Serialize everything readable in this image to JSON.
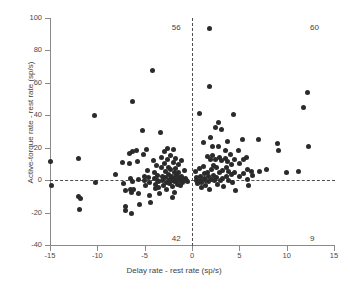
{
  "chart_data": {
    "type": "scatter",
    "title": "",
    "xlabel": "Delay rate - rest rate  (sp/s)",
    "ylabel": "Active-torque rate - rest rate  (sp/s)",
    "xlim": [
      -15,
      15
    ],
    "ylim": [
      -40,
      100
    ],
    "xticks": [
      -15,
      -10,
      -5,
      0,
      5,
      10,
      15
    ],
    "yticks": [
      -40,
      -20,
      0,
      20,
      40,
      60,
      80,
      100
    ],
    "xtick_labels": [
      "-15",
      "-10",
      "-5",
      "0",
      "5",
      "10",
      "15"
    ],
    "ytick_labels": [
      "-40",
      "-20",
      "0",
      "20",
      "40",
      "60",
      "80",
      "100"
    ],
    "grid": false,
    "legend": null,
    "reference_lines": [
      {
        "orientation": "vertical",
        "value": 0,
        "style": "dashed"
      },
      {
        "orientation": "horizontal",
        "value": 0,
        "style": "dashed"
      }
    ],
    "annotations": [
      {
        "text": "56",
        "x": -1.4,
        "y": 94,
        "meaning": "count-upper-left-quadrant"
      },
      {
        "text": "60",
        "x": 13.2,
        "y": 94,
        "meaning": "count-upper-right-quadrant"
      },
      {
        "text": "42",
        "x": -1.4,
        "y": -36,
        "meaning": "count-lower-left-quadrant"
      },
      {
        "text": "9",
        "x": 13.2,
        "y": -36,
        "meaning": "count-lower-right-quadrant"
      }
    ],
    "marker": {
      "shape": "circle",
      "color": "#2b2b2b",
      "size": 5
    },
    "points": [
      [
        -14.9,
        11.5
      ],
      [
        -14.8,
        -3.0
      ],
      [
        -12.0,
        13.5
      ],
      [
        -12.0,
        -10.0
      ],
      [
        -11.8,
        -11.5
      ],
      [
        -11.9,
        -18.0
      ],
      [
        -10.3,
        39.7
      ],
      [
        -10.2,
        -1.5
      ],
      [
        -8.1,
        3.5
      ],
      [
        -7.3,
        11.0
      ],
      [
        -7.2,
        -2.0
      ],
      [
        -7.0,
        -6.5
      ],
      [
        -7.0,
        -16.0
      ],
      [
        -7.0,
        -19.0
      ],
      [
        -6.6,
        16.5
      ],
      [
        -6.6,
        10.5
      ],
      [
        -6.5,
        1.0
      ],
      [
        -6.5,
        -5.5
      ],
      [
        -6.4,
        -7.5
      ],
      [
        -6.4,
        -20.5
      ],
      [
        -6.3,
        48.5
      ],
      [
        -6.3,
        17.5
      ],
      [
        -6.3,
        -1.0
      ],
      [
        -6.2,
        -6.0
      ],
      [
        -5.9,
        18.0
      ],
      [
        -5.8,
        11.5
      ],
      [
        -5.7,
        0.5
      ],
      [
        -5.6,
        -8.5
      ],
      [
        -5.5,
        -15.0
      ],
      [
        -5.2,
        30.8
      ],
      [
        -5.1,
        16.0
      ],
      [
        -5.0,
        2.5
      ],
      [
        -5.0,
        -0.5
      ],
      [
        -4.9,
        -3.5
      ],
      [
        -4.8,
        19.0
      ],
      [
        -4.7,
        6.0
      ],
      [
        -4.6,
        1.5
      ],
      [
        -4.5,
        -1.5
      ],
      [
        -4.5,
        -9.5
      ],
      [
        -4.4,
        -13.5
      ],
      [
        -4.2,
        67.5
      ],
      [
        -4.1,
        12.0
      ],
      [
        -4.0,
        5.0
      ],
      [
        -4.0,
        1.0
      ],
      [
        -3.9,
        -2.5
      ],
      [
        -3.9,
        -5.0
      ],
      [
        -3.7,
        9.0
      ],
      [
        -3.6,
        3.0
      ],
      [
        -3.6,
        0.0
      ],
      [
        -3.5,
        -1.0
      ],
      [
        -3.5,
        -4.5
      ],
      [
        -3.4,
        -8.0
      ],
      [
        -3.3,
        29.3
      ],
      [
        -3.2,
        14.0
      ],
      [
        -3.2,
        7.5
      ],
      [
        -3.1,
        2.0
      ],
      [
        -3.1,
        -0.5
      ],
      [
        -3.0,
        -3.0
      ],
      [
        -2.9,
        17.5
      ],
      [
        -2.9,
        10.0
      ],
      [
        -2.8,
        5.5
      ],
      [
        -2.8,
        1.5
      ],
      [
        -2.7,
        -1.5
      ],
      [
        -2.7,
        -6.0
      ],
      [
        -2.6,
        19.5
      ],
      [
        -2.6,
        12.5
      ],
      [
        -2.5,
        8.0
      ],
      [
        -2.5,
        3.5
      ],
      [
        -2.4,
        0.5
      ],
      [
        -2.4,
        -2.0
      ],
      [
        -2.3,
        15.0
      ],
      [
        -2.3,
        6.5
      ],
      [
        -2.2,
        2.5
      ],
      [
        -2.2,
        -0.5
      ],
      [
        -2.1,
        -4.0
      ],
      [
        -2.1,
        -11.0
      ],
      [
        -2.0,
        19.0
      ],
      [
        -2.0,
        11.0
      ],
      [
        -1.9,
        4.5
      ],
      [
        -1.9,
        1.0
      ],
      [
        -1.8,
        -1.0
      ],
      [
        -1.8,
        -7.5
      ],
      [
        -1.7,
        13.5
      ],
      [
        -1.7,
        7.0
      ],
      [
        -1.6,
        3.0
      ],
      [
        -1.6,
        0.0
      ],
      [
        -1.5,
        -2.5
      ],
      [
        -1.4,
        9.5
      ],
      [
        -1.4,
        5.0
      ],
      [
        -1.3,
        1.5
      ],
      [
        -1.3,
        -0.5
      ],
      [
        -1.2,
        -3.5
      ],
      [
        -1.1,
        12.0
      ],
      [
        -1.1,
        2.0
      ],
      [
        -1.0,
        0.5
      ],
      [
        -1.0,
        -1.5
      ],
      [
        -0.8,
        6.0
      ],
      [
        -0.7,
        1.0
      ],
      [
        -0.6,
        0.0
      ],
      [
        -0.5,
        -1.0
      ],
      [
        0.4,
        5.5
      ],
      [
        0.5,
        1.5
      ],
      [
        0.5,
        -0.5
      ],
      [
        0.6,
        -2.0
      ],
      [
        0.8,
        41.3
      ],
      [
        0.8,
        7.0
      ],
      [
        0.9,
        2.5
      ],
      [
        0.9,
        0.0
      ],
      [
        1.0,
        -1.5
      ],
      [
        1.0,
        -4.5
      ],
      [
        1.2,
        23.0
      ],
      [
        1.2,
        8.5
      ],
      [
        1.3,
        4.0
      ],
      [
        1.3,
        1.0
      ],
      [
        1.4,
        -0.5
      ],
      [
        1.4,
        -3.0
      ],
      [
        1.6,
        14.5
      ],
      [
        1.6,
        5.0
      ],
      [
        1.7,
        2.0
      ],
      [
        1.7,
        -1.0
      ],
      [
        1.8,
        -5.5
      ],
      [
        1.9,
        93.3
      ],
      [
        1.9,
        58.0
      ],
      [
        2.0,
        26.5
      ],
      [
        2.0,
        12.5
      ],
      [
        2.1,
        6.5
      ],
      [
        2.1,
        0.5
      ],
      [
        2.2,
        20.5
      ],
      [
        2.2,
        15.5
      ],
      [
        2.3,
        9.0
      ],
      [
        2.3,
        3.0
      ],
      [
        2.4,
        -0.5
      ],
      [
        2.5,
        32.5
      ],
      [
        2.5,
        13.0
      ],
      [
        2.6,
        7.5
      ],
      [
        2.6,
        1.5
      ],
      [
        2.7,
        -2.5
      ],
      [
        2.8,
        35.5
      ],
      [
        2.8,
        21.0
      ],
      [
        2.9,
        14.0
      ],
      [
        2.9,
        4.5
      ],
      [
        3.0,
        -0.5
      ],
      [
        3.1,
        31.0
      ],
      [
        3.1,
        12.0
      ],
      [
        3.2,
        6.0
      ],
      [
        3.2,
        1.0
      ],
      [
        3.3,
        -4.0
      ],
      [
        3.5,
        18.5
      ],
      [
        3.5,
        13.5
      ],
      [
        3.6,
        8.0
      ],
      [
        3.6,
        2.5
      ],
      [
        3.8,
        24.0
      ],
      [
        3.8,
        11.5
      ],
      [
        3.9,
        5.5
      ],
      [
        3.9,
        0.0
      ],
      [
        4.1,
        16.0
      ],
      [
        4.2,
        9.5
      ],
      [
        4.2,
        3.5
      ],
      [
        4.3,
        -1.5
      ],
      [
        4.4,
        40.5
      ],
      [
        4.5,
        13.0
      ],
      [
        4.5,
        5.0
      ],
      [
        4.6,
        -6.5
      ],
      [
        4.9,
        18.5
      ],
      [
        5.0,
        10.0
      ],
      [
        5.0,
        2.0
      ],
      [
        5.3,
        24.8
      ],
      [
        5.4,
        12.5
      ],
      [
        5.4,
        4.0
      ],
      [
        5.8,
        14.0
      ],
      [
        5.9,
        6.5
      ],
      [
        5.9,
        0.5
      ],
      [
        6.0,
        -3.5
      ],
      [
        6.3,
        5.5
      ],
      [
        6.4,
        3.0
      ],
      [
        7.0,
        25.0
      ],
      [
        7.1,
        5.5
      ],
      [
        7.9,
        6.5
      ],
      [
        9.0,
        22.8
      ],
      [
        9.1,
        18.5
      ],
      [
        10.0,
        4.8
      ],
      [
        11.3,
        5.3
      ],
      [
        11.8,
        44.5
      ],
      [
        12.2,
        53.8
      ],
      [
        12.3,
        20.8
      ]
    ]
  },
  "axes": {
    "y_title": "Active-torque rate - rest rate  (sp/s)",
    "x_title": "Delay rate - rest rate  (sp/s)"
  },
  "quadrant_counts": {
    "upper_left": "56",
    "upper_right": "60",
    "lower_left": "42",
    "lower_right": "9"
  },
  "colors": {
    "marker": "#2b2b2b",
    "axis": "#8a8a8a",
    "reference_line": "#4d4d4d",
    "text": "#3f3f3f",
    "background": "#ffffff"
  }
}
